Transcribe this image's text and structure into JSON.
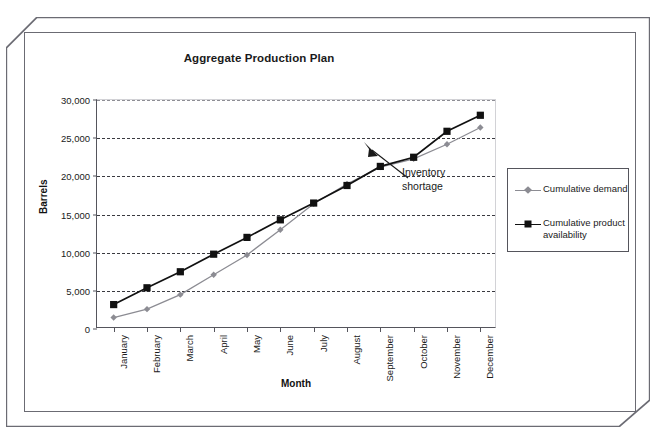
{
  "page_header": {
    "text": "",
    "page_number": ""
  },
  "chart": {
    "title": "Aggregate Production Plan",
    "x_axis_title": "Month",
    "y_axis_title": "Barrels",
    "annotation": "Inventory shortage",
    "colors": {
      "demand": "#8c8c93",
      "availability": "#111111",
      "axis": "#55555c",
      "grid": "#3a3a40",
      "frame": "#6b6b73",
      "background": "#ffffff"
    }
  },
  "legend": {
    "position": "right",
    "entries": [
      {
        "label": "Cumulative demand",
        "marker": "diamond",
        "color": "#8c8c93"
      },
      {
        "label": "Cumulative product availability",
        "marker": "square",
        "color": "#111111"
      }
    ]
  },
  "chart_data": {
    "type": "line",
    "title": "Aggregate Production Plan",
    "xlabel": "Month",
    "ylabel": "Barrels",
    "ylim": [
      0,
      30000
    ],
    "ytick_labels": [
      "0",
      "5,000",
      "10,000",
      "15,000",
      "20,000",
      "25,000",
      "30,000"
    ],
    "yticks": [
      0,
      5000,
      10000,
      15000,
      20000,
      25000,
      30000
    ],
    "grid": true,
    "legend_position": "right",
    "annotations": [
      {
        "text": "Inventory shortage",
        "points_to": "August",
        "value": 18800
      }
    ],
    "categories": [
      "January",
      "February",
      "March",
      "April",
      "May",
      "June",
      "July",
      "August",
      "September",
      "October",
      "November",
      "December"
    ],
    "series": [
      {
        "name": "Cumulative demand",
        "marker": "diamond",
        "color": "#8c8c93",
        "values": [
          1500,
          2600,
          4500,
          7100,
          9700,
          13000,
          16400,
          19000,
          21200,
          22300,
          24200,
          26400
        ]
      },
      {
        "name": "Cumulative product availability",
        "marker": "square",
        "color": "#111111",
        "values": [
          3200,
          5400,
          7500,
          9800,
          12000,
          14300,
          16500,
          18800,
          21300,
          22500,
          25900,
          28000
        ]
      }
    ]
  }
}
